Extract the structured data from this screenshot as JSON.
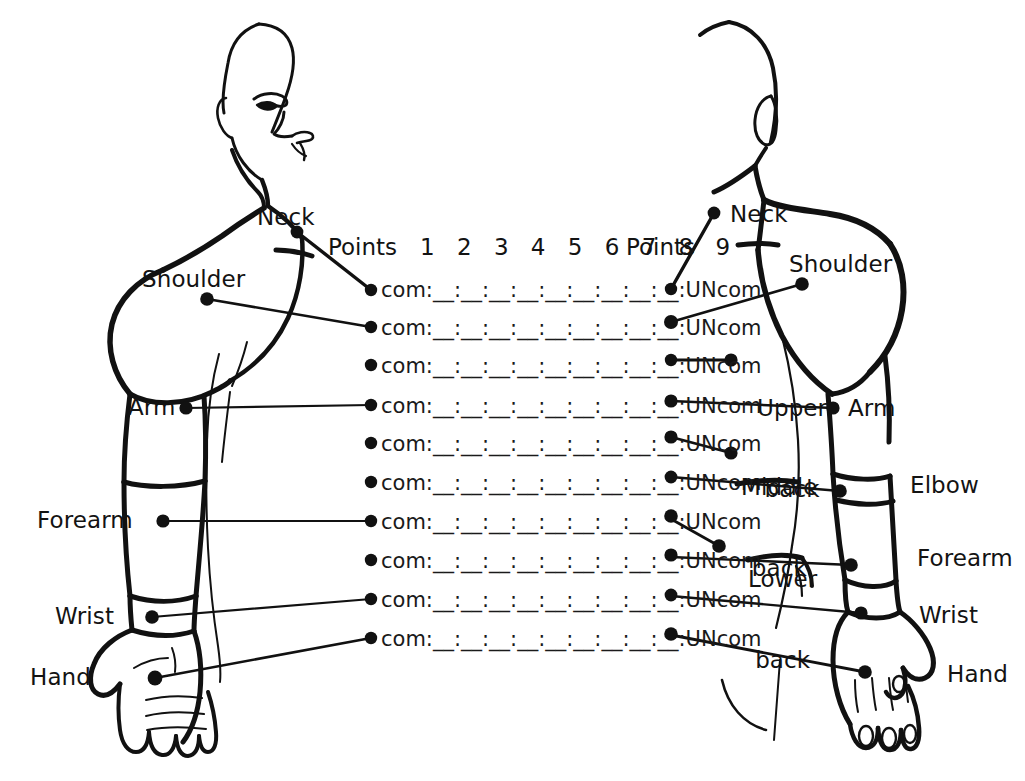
{
  "diagram": {
    "ink_color": "#111111",
    "background_color": "#ffffff"
  },
  "header": {
    "points_left": "Points",
    "points_right": "Points",
    "numbers": "1 2 3 4 5 6 7 8 9"
  },
  "row_template": {
    "left_label": "com:",
    "blanks": "__:__:__:__:__:__:__:__:__",
    "right_label": ":UNcom",
    "full": "com:__:__:__:__:__:__:__:__:__:UNcom",
    "count": 10
  },
  "rows": [
    {
      "index": 1,
      "text": "com:__:__:__:__:__:__:__:__:__:UNcom"
    },
    {
      "index": 2,
      "text": "com:__:__:__:__:__:__:__:__:__:UNcom"
    },
    {
      "index": 3,
      "text": "com:__:__:__:__:__:__:__:__:__:UNcom"
    },
    {
      "index": 4,
      "text": "com:__:__:__:__:__:__:__:__:__:UNcom"
    },
    {
      "index": 5,
      "text": "com:__:__:__:__:__:__:__:__:__:UNcom"
    },
    {
      "index": 6,
      "text": "com:__:__:__:__:__:__:__:__:__:UNcom"
    },
    {
      "index": 7,
      "text": "com:__:__:__:__:__:__:__:__:__:UNcom"
    },
    {
      "index": 8,
      "text": "com:__:__:__:__:__:__:__:__:__:UNcom"
    },
    {
      "index": 9,
      "text": "com:__:__:__:__:__:__:__:__:__:UNcom"
    },
    {
      "index": 10,
      "text": "com:__:__:__:__:__:__:__:__:__:UNcom"
    }
  ],
  "front_figure": {
    "view": "front",
    "labels": [
      {
        "key": "neck",
        "text": "Neck"
      },
      {
        "key": "shoulder",
        "text": "Shoulder"
      },
      {
        "key": "arm",
        "text": "Arm"
      },
      {
        "key": "forearm",
        "text": "Forearm"
      },
      {
        "key": "wrist",
        "text": "Wrist"
      },
      {
        "key": "hand",
        "text": "Hand"
      }
    ]
  },
  "back_figure": {
    "view": "back",
    "labels": [
      {
        "key": "neck",
        "text": "Neck"
      },
      {
        "key": "shoulder",
        "text": "Shoulder"
      },
      {
        "key": "upper_back",
        "line1": "Upper",
        "line2": "back"
      },
      {
        "key": "arm",
        "text": "Arm"
      },
      {
        "key": "middle_back",
        "line1": "Middle",
        "line2": "back"
      },
      {
        "key": "elbow",
        "text": "Elbow"
      },
      {
        "key": "lower_back",
        "line1": "Lower",
        "line2": "back"
      },
      {
        "key": "forearm",
        "text": "Forearm"
      },
      {
        "key": "wrist",
        "text": "Wrist"
      },
      {
        "key": "hand",
        "text": "Hand"
      }
    ]
  }
}
